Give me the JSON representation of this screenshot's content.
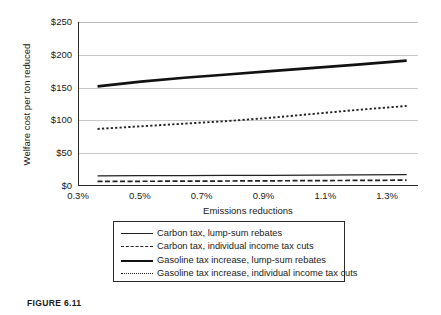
{
  "figure": {
    "caption": "FIGURE 6.11"
  },
  "chart_data": {
    "type": "line",
    "title": "",
    "xlabel": "Emissions reductions",
    "ylabel": "Welfare cost per ton reduced",
    "xlim": [
      0.3,
      1.4
    ],
    "ylim": [
      0,
      250
    ],
    "xticks": [
      "0.3%",
      "0.5%",
      "0.7%",
      "0.9%",
      "1.1%",
      "1.3%"
    ],
    "xtick_values": [
      0.3,
      0.5,
      0.7,
      0.9,
      1.1,
      1.3
    ],
    "yticks": [
      "$0",
      "$50",
      "$100",
      "$150",
      "$200",
      "$250"
    ],
    "ytick_values": [
      0,
      50,
      100,
      150,
      200,
      250
    ],
    "grid": "horizontal",
    "legend_position": "below",
    "x": [
      0.36,
      0.5,
      0.64,
      0.78,
      0.92,
      1.06,
      1.2,
      1.36
    ],
    "series": [
      {
        "name": "Carbon tax, lump-sum rebates",
        "style": "solid-thin",
        "values": [
          15.5,
          15.7,
          15.9,
          16.1,
          16.3,
          16.6,
          16.9,
          17.2
        ]
      },
      {
        "name": "Carbon tax, individual income tax cuts",
        "style": "dash-dot",
        "values": [
          7.0,
          7.2,
          7.4,
          7.6,
          7.9,
          8.2,
          8.5,
          8.9
        ]
      },
      {
        "name": "Gasoline tax increase, lump-sum rebates",
        "style": "solid-thick",
        "values": [
          152,
          159,
          165,
          170,
          175,
          180,
          185,
          191
        ]
      },
      {
        "name": "Gasoline tax increase, individual income tax cuts",
        "style": "dotted",
        "values": [
          87,
          91,
          95,
          99,
          104,
          110,
          116,
          122
        ]
      }
    ]
  }
}
